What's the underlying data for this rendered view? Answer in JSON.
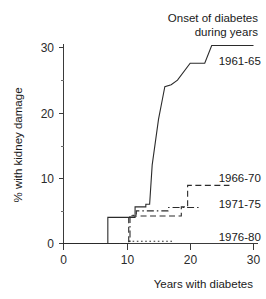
{
  "chart_data": {
    "type": "line",
    "title": "Onset of diabetes during years",
    "title_line1": "Onset of diabetes",
    "title_line2": "during years",
    "xlabel": "Years with diabetes",
    "ylabel": "% with kidney damage",
    "xlim": [
      0,
      30
    ],
    "ylim": [
      0,
      31
    ],
    "grid": false,
    "legend_position": "right-inline",
    "xticks": [
      0,
      10,
      20,
      30
    ],
    "xtick_labels": [
      "0",
      "10",
      "20",
      "30"
    ],
    "yticks": [
      0,
      10,
      20,
      30
    ],
    "ytick_labels": [
      "0",
      "10",
      "20",
      "30"
    ],
    "yticks_minor": [
      5,
      15,
      25
    ],
    "series": [
      {
        "name": "1961-65",
        "style": "solid",
        "label_x": 24.5,
        "label_y": 28.0,
        "points": [
          [
            0,
            0
          ],
          [
            7,
            0
          ],
          [
            7,
            4
          ],
          [
            8.2,
            4
          ],
          [
            8.2,
            4
          ],
          [
            11.3,
            4
          ],
          [
            11.3,
            5.6
          ],
          [
            13.0,
            5.6
          ],
          [
            13.0,
            6.0
          ],
          [
            13.6,
            6.0
          ],
          [
            14.0,
            12.0
          ],
          [
            15.0,
            19.0
          ],
          [
            15.6,
            22.0
          ],
          [
            16.0,
            24.0
          ],
          [
            17.0,
            24.3
          ],
          [
            18.0,
            25.0
          ],
          [
            20.0,
            27.6
          ],
          [
            22.3,
            27.6
          ],
          [
            23.4,
            30.3
          ],
          [
            30,
            30.3
          ]
        ]
      },
      {
        "name": "1966-70",
        "style": "dashed",
        "label_x": 24.5,
        "label_y": 10.0,
        "points": [
          [
            0,
            0
          ],
          [
            10.3,
            0
          ],
          [
            10.3,
            4.2
          ],
          [
            18.6,
            4.2
          ],
          [
            18.6,
            5.6
          ],
          [
            19.6,
            5.6
          ],
          [
            19.6,
            8.9
          ],
          [
            26.2,
            8.9
          ]
        ]
      },
      {
        "name": "1971-75",
        "style": "dashdot",
        "label_x": 24.5,
        "label_y": 6.0,
        "points": [
          [
            0,
            0
          ],
          [
            10.5,
            0
          ],
          [
            10.5,
            4.3
          ],
          [
            11.5,
            4.3
          ],
          [
            11.5,
            5.0
          ],
          [
            16.5,
            5.0
          ],
          [
            16.5,
            5.5
          ],
          [
            21.5,
            5.5
          ]
        ]
      },
      {
        "name": "1976-80",
        "style": "dotted",
        "label_x": 24.5,
        "label_y": 1.0,
        "points": [
          [
            0,
            0
          ],
          [
            10.2,
            0
          ],
          [
            10.2,
            0.35
          ],
          [
            17.3,
            0.35
          ]
        ]
      }
    ]
  }
}
